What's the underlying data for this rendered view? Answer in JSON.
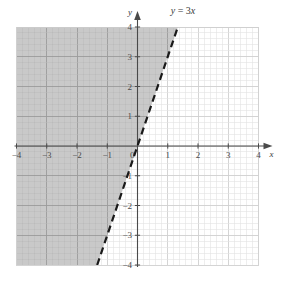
{
  "figure": {
    "title": "",
    "equation_label": "y = 3x",
    "x_axis_label": "x",
    "y_axis_label": "y"
  },
  "chart_data": {
    "type": "line",
    "title": "y = 3x",
    "xlabel": "x",
    "ylabel": "y",
    "xlim": [
      -4,
      4
    ],
    "ylim": [
      -4,
      4
    ],
    "grid": true,
    "minor_grid": true,
    "minor_divisions_per_unit": 5,
    "legend": "none",
    "x_ticks": [
      -4,
      -3,
      -2,
      -1,
      0,
      1,
      2,
      3,
      4
    ],
    "y_ticks": [
      -4,
      -3,
      -2,
      -1,
      0,
      1,
      2,
      3,
      4
    ],
    "x_tick_labels": [
      "-4",
      "-3",
      "-2",
      "-1",
      "0",
      "1",
      "2",
      "3",
      "4"
    ],
    "y_tick_labels": [
      "4",
      "3",
      "2",
      "1",
      "0",
      "-1",
      "-2",
      "-3",
      "-4"
    ],
    "series": [
      {
        "name": "y = 3x",
        "kind": "line",
        "equation": "y = 3x",
        "slope": 3,
        "intercept": 0,
        "linestyle": "dashed",
        "color": "#1a1a1a",
        "linewidth": 2.2,
        "points": [
          {
            "x": -1.3333,
            "y": -4
          },
          {
            "x": 0,
            "y": 0
          },
          {
            "x": 1.3333,
            "y": 4
          }
        ]
      }
    ],
    "shaded_region": {
      "name": "y > 3x",
      "inequality": "y > 3x",
      "side": "left",
      "boundary_included": false,
      "color": "#c9c9c9"
    },
    "annotations": [
      {
        "text": "y = 3x",
        "x": 1.1,
        "y": 4.45
      }
    ]
  },
  "colors": {
    "shade_fill": "#c9c9c9",
    "grid_minor_shaded": "#b4b4b4",
    "grid_major_shaded": "#9a9a9a",
    "grid_minor_plain": "#e2e2e2",
    "grid_major_plain": "#cfcfcf",
    "axis": "#4a4a4a",
    "line": "#1a1a1a",
    "text": "#3a3a3a"
  },
  "icons": {
    "x_axis_arrow": "arrow-right-icon",
    "y_axis_arrow": "arrow-up-icon"
  }
}
